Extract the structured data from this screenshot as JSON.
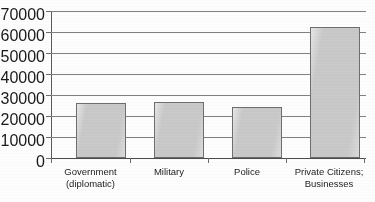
{
  "chart_data": {
    "type": "bar",
    "title": "",
    "xlabel": "",
    "ylabel": "",
    "categories": [
      "Government\n(diplomatic)",
      "Military",
      "Police",
      "Private Citizens;\nBusinesses"
    ],
    "values": [
      26000,
      26500,
      24500,
      62500
    ],
    "ylim": [
      0,
      70000
    ],
    "ytick_labels": [
      "70000",
      "60000",
      "50000",
      "40000",
      "30000",
      "20000",
      "10000",
      "0"
    ],
    "ytick_values": [
      70000,
      60000,
      50000,
      40000,
      30000,
      20000,
      10000,
      0
    ],
    "grid": "horizontal",
    "legend": "none",
    "bar_fill_color": "#c9c9c9",
    "bar_border_color": "#6e6e6e",
    "gridline_color": "#808080",
    "axis_color": "#5a5a5a",
    "background_color": "#ffffff"
  },
  "caption": {
    "cropped_text": ""
  }
}
